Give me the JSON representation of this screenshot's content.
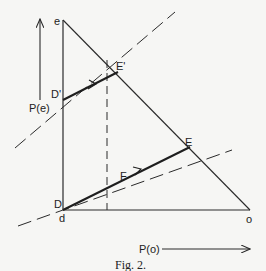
{
  "figure": {
    "caption": "Fig. 2.",
    "ink_color": "#2a2a2a",
    "background": "#f6f6f4"
  },
  "labels": {
    "e": "e",
    "d": "d",
    "o": "o",
    "D": "D",
    "D_prime": "D'",
    "E": "E",
    "E_prime": "E'",
    "F": "F",
    "P_e": "P(e)",
    "P_o": "P(o)"
  },
  "points": {
    "e": [
      63,
      20
    ],
    "d": [
      63,
      210
    ],
    "o": [
      250,
      210
    ],
    "D": [
      63,
      210
    ],
    "D_prime": [
      63,
      100
    ],
    "E": [
      190,
      147
    ],
    "E_prime": [
      118,
      72
    ],
    "F": [
      120,
      183
    ]
  }
}
